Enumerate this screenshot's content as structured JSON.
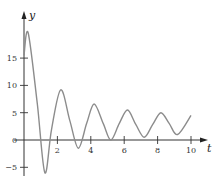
{
  "chart_data": {
    "type": "line",
    "title": "",
    "xlabel": "t",
    "ylabel": "y",
    "xlim": [
      0,
      10
    ],
    "ylim": [
      -5,
      20
    ],
    "x_ticks": [
      2,
      4,
      6,
      8,
      10
    ],
    "x_tick_labels": [
      "2",
      "4",
      "6",
      "8",
      "10"
    ],
    "y_ticks": [
      -5,
      0,
      5,
      10,
      15
    ],
    "y_tick_labels": [
      "−5",
      "0",
      "5",
      "10",
      "15"
    ],
    "grid": false,
    "legend": null,
    "series": [
      {
        "name": "y(t)",
        "color": "#8c8c8c",
        "x": [
          0,
          0.25,
          0.8,
          1.25,
          1.65,
          2.2,
          2.75,
          3.25,
          3.75,
          4.2,
          4.75,
          5.2,
          5.7,
          6.2,
          6.7,
          7.2,
          7.7,
          8.2,
          8.7,
          9.2,
          10
        ],
        "values": [
          15.5,
          19.6,
          6.5,
          -6.0,
          2.0,
          9.2,
          3.5,
          -1.5,
          3.0,
          6.6,
          3.0,
          0.0,
          3.0,
          5.5,
          2.8,
          0.5,
          2.8,
          5.0,
          3.0,
          1.0,
          4.5
        ]
      }
    ],
    "axis_color": "#333333"
  }
}
